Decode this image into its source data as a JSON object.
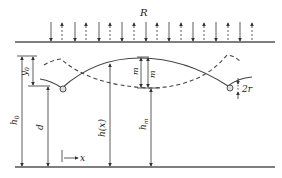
{
  "diagram": {
    "title_label": "R",
    "labels": {
      "y0": "y",
      "y0_sub": "0",
      "h0": "h",
      "h0_sub": "0",
      "d": "d",
      "hx": "h(x)",
      "m_left": "m",
      "m_right": "m",
      "hm": "h",
      "hm_sub": "m",
      "two_r": "2r",
      "x_axis": "x"
    },
    "elements": {
      "top_boundary": "boundary line with alternating down (solid) and up (dashed) arrows R",
      "bottom_boundary": "bottom line",
      "solid_curve": "interface profile (solid)",
      "dashed_curve": "interface profile (dashed, shifted)",
      "cylinders": [
        "left cylinder",
        "right cylinder"
      ]
    },
    "colors": {
      "line": "#444444",
      "text": "#222222",
      "background": "#ffffff"
    }
  }
}
